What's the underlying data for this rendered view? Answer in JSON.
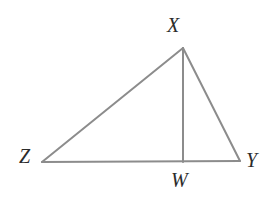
{
  "figure": {
    "type": "geometry-diagram",
    "background_color": "#ffffff",
    "stroke_color": "#8c8c8c",
    "label_color": "#2b2b2b",
    "stroke_width": 2,
    "canvas": {
      "width": 277,
      "height": 201
    }
  },
  "points": {
    "X": {
      "label": "X",
      "x": 183,
      "y": 48
    },
    "Y": {
      "label": "Y",
      "x": 240,
      "y": 161
    },
    "Z": {
      "label": "Z",
      "x": 42,
      "y": 162
    },
    "W": {
      "label": "W",
      "x": 183,
      "y": 162
    }
  },
  "segments": [
    {
      "name": "ZX",
      "from": "Z",
      "to": "X"
    },
    {
      "name": "XY",
      "from": "X",
      "to": "Y"
    },
    {
      "name": "ZY",
      "from": "Z",
      "to": "Y"
    },
    {
      "name": "XW",
      "from": "X",
      "to": "W"
    }
  ],
  "labels": {
    "X": "X",
    "Y": "Y",
    "Z": "Z",
    "W": "W"
  }
}
